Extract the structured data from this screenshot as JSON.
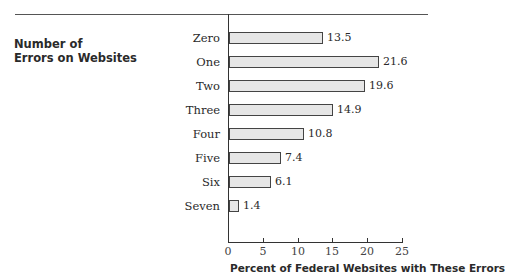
{
  "chart_data": {
    "type": "bar",
    "orientation": "horizontal",
    "title": "",
    "ylabel": "Number of Errors on Websites",
    "ylabel_lines": [
      "Number of",
      "Errors on Websites"
    ],
    "xlabel": "Percent of Federal Websites with These Errors",
    "categories": [
      "Zero",
      "One",
      "Two",
      "Three",
      "Four",
      "Five",
      "Six",
      "Seven"
    ],
    "values": [
      13.5,
      21.6,
      19.6,
      14.9,
      10.8,
      7.4,
      6.1,
      1.4
    ],
    "value_labels": [
      "13.5",
      "21.6",
      "19.6",
      "14.9",
      "10.8",
      "7.4",
      "6.1",
      "1.4"
    ],
    "xlim": [
      0,
      25
    ],
    "xticks": [
      "0",
      "5",
      "10",
      "15",
      "20",
      "25"
    ],
    "grid": false,
    "legend": null,
    "bar_color": "#e6e6e6",
    "bar_edge_color": "#444444"
  }
}
